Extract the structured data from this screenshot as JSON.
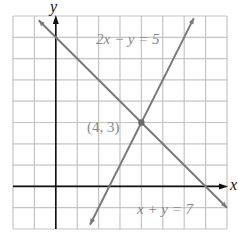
{
  "chart_data": {
    "type": "line",
    "title": "",
    "xlabel": "x",
    "ylabel": "y",
    "xlim": [
      -2,
      8
    ],
    "ylim": [
      -2,
      8
    ],
    "grid": true,
    "grid_step": 1,
    "series": [
      {
        "name": "2x − y = 5",
        "equation": "y = 2x - 5",
        "slope": 2,
        "intercept": -5,
        "x_range": [
          1.6,
          6.45
        ],
        "color": "#7a7a7a"
      },
      {
        "name": "x + y = 7",
        "equation": "y = -x + 7",
        "slope": -1,
        "intercept": 7,
        "x_range": [
          -0.8,
          8
        ],
        "color": "#7a7a7a"
      }
    ],
    "annotations": [
      {
        "text": "(4, 3)",
        "x": 4,
        "y": 3,
        "type": "intersection-point"
      },
      {
        "text": "2x − y = 5",
        "x": 3.6,
        "y": 7
      },
      {
        "text": "x + y = 7",
        "x": 5.5,
        "y": -1.3
      }
    ]
  },
  "labels": {
    "x_axis": "x",
    "y_axis": "y",
    "line1": "2x − y = 5",
    "line2": "x + y = 7",
    "point": "(4, 3)"
  },
  "colors": {
    "grid": "#c4c4c4",
    "axis": "#111111",
    "line": "#7a7a7a",
    "label": "#8a8a8a"
  }
}
